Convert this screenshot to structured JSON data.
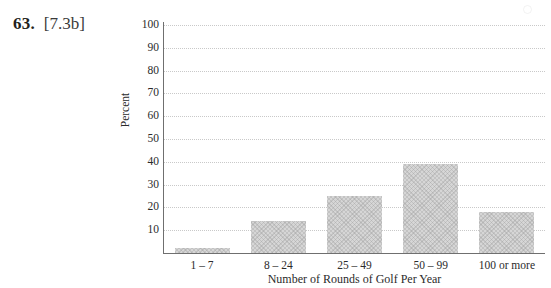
{
  "problem": {
    "number": "63.",
    "objective": "[7.3b]"
  },
  "chart_data": {
    "type": "bar",
    "title": "",
    "xlabel": "Number of Rounds of Golf Per Year",
    "ylabel": "Percent",
    "categories": [
      "1 – 7",
      "8 – 24",
      "25 – 49",
      "50 – 99",
      "100 or more"
    ],
    "values": [
      2,
      14,
      25,
      39,
      18
    ],
    "ylim": [
      0,
      100
    ],
    "ytick_labels": [
      "100",
      "90",
      "80",
      "70",
      "60",
      "50",
      "40",
      "30",
      "20",
      "10"
    ],
    "ytick_values": [
      100,
      90,
      80,
      70,
      60,
      50,
      40,
      30,
      20,
      10
    ],
    "grid": true,
    "grid_style": "dotted",
    "legend": "none",
    "bar_color": "#d6d6d6",
    "axis_color": "#6f6f6f",
    "gridline_color": "#c9c9c9"
  }
}
